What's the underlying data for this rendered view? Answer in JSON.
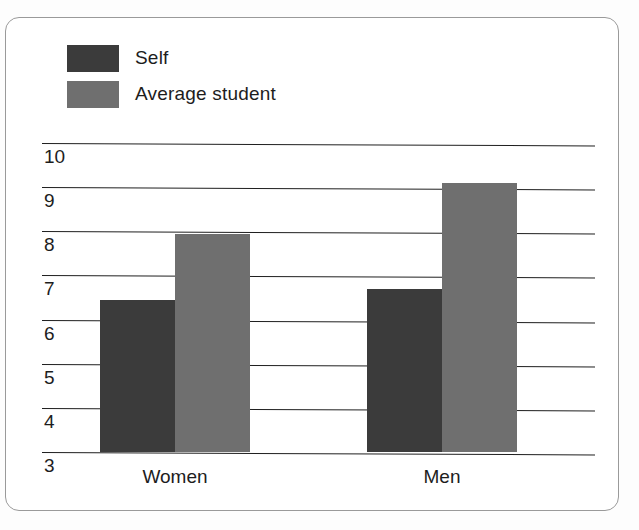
{
  "chart_data": {
    "type": "bar",
    "title": "",
    "subtitle": "",
    "xlabel": "",
    "ylabel": "",
    "categories": [
      "Women",
      "Men"
    ],
    "series": [
      {
        "name": "Self",
        "color": "#3b3b3b",
        "values": [
          6.45,
          6.7
        ]
      },
      {
        "name": "Average student",
        "color": "#6f6f6f",
        "values": [
          7.95,
          9.1
        ]
      }
    ],
    "ylim": [
      3,
      10
    ],
    "yticks": [
      10,
      9,
      8,
      7,
      6,
      5,
      4,
      3
    ],
    "ytick_labels": [
      "10",
      "9",
      "8",
      "7",
      "6",
      "5",
      "4",
      "3"
    ],
    "grid": true,
    "grid_axis": "y",
    "legend_position": "top-left",
    "bar_group_gap": true
  },
  "legend": {
    "items": [
      {
        "label": "Self",
        "swatch_color": "#3b3b3b",
        "swatch_name": "legend-swatch-self"
      },
      {
        "label": "Average student",
        "swatch_color": "#6f6f6f",
        "swatch_name": "legend-swatch-average-student"
      }
    ]
  },
  "axis": {
    "y_ticks": [
      "10",
      "9",
      "8",
      "7",
      "6",
      "5",
      "4",
      "3"
    ],
    "x_categories": [
      "Women",
      "Men"
    ]
  },
  "colors": {
    "self": "#3b3b3b",
    "average_student": "#6f6f6f",
    "gridline": "#1f1f1f",
    "text": "#1d1d1d",
    "frame": "#9a9a9a",
    "page_background": "#ffffff"
  }
}
